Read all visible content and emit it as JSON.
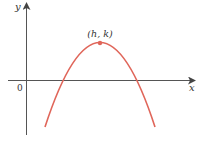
{
  "diagram": {
    "type": "parabola-graph",
    "axes": {
      "x_label": "x",
      "y_label": "y",
      "origin_label": "0"
    },
    "vertex": {
      "label": "(h, k)"
    },
    "colors": {
      "curve": "#e0665a",
      "axes": "#555555",
      "text": "#333333"
    }
  }
}
